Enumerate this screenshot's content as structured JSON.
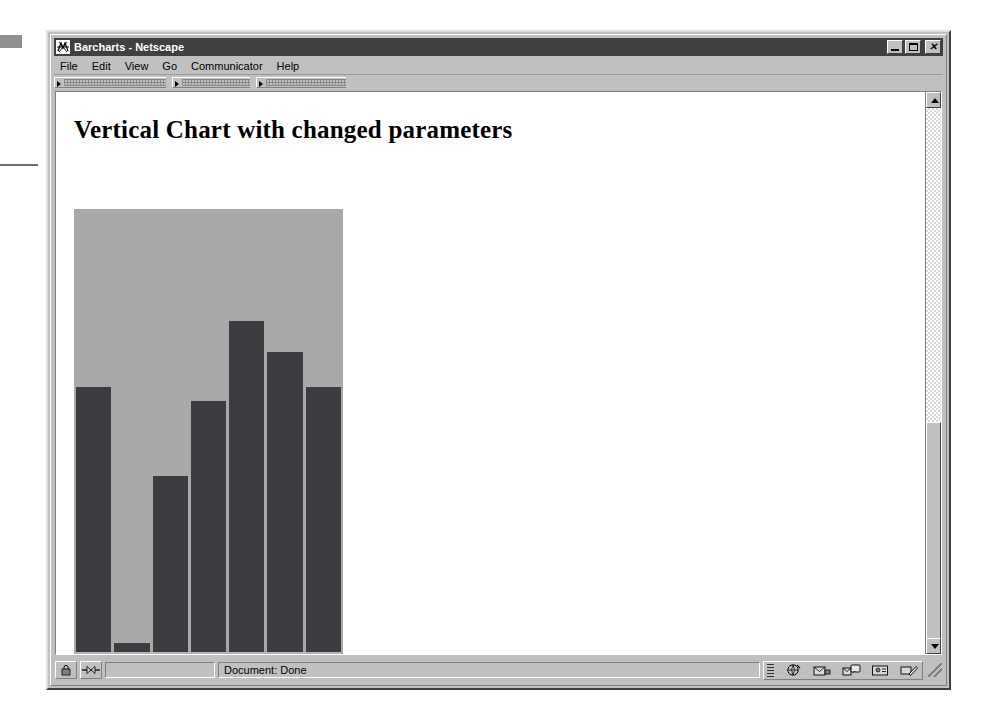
{
  "window": {
    "title": "Barcharts - Netscape",
    "icon": "netscape-logo-icon",
    "controls": {
      "minimize_label": "_",
      "maximize_label": "□",
      "close_label": "✕"
    }
  },
  "menubar": {
    "items": [
      {
        "label": "File",
        "accel": "F"
      },
      {
        "label": "Edit",
        "accel": "E"
      },
      {
        "label": "View",
        "accel": "V"
      },
      {
        "label": "Go",
        "accel": "G"
      },
      {
        "label": "Communicator",
        "accel": "C"
      },
      {
        "label": "Help",
        "accel": "H"
      }
    ]
  },
  "toolbar": {
    "grippies": [
      "navigation-toolbar-grippy",
      "location-toolbar-grippy",
      "personal-toolbar-grippy"
    ]
  },
  "page": {
    "heading": "Vertical Chart with changed parameters"
  },
  "chart_data": {
    "type": "bar",
    "title": "Vertical Chart with changed parameters",
    "orientation": "vertical",
    "categories": [
      "1",
      "2",
      "3",
      "4",
      "5",
      "6",
      "7"
    ],
    "values": [
      60,
      2,
      40,
      57,
      75,
      68,
      60
    ],
    "xlabel": "",
    "ylabel": "",
    "ylim": [
      0,
      100
    ],
    "grid": false,
    "legend": null,
    "bar_color": "#3d3d41",
    "plot_background": "#a9a9a9",
    "axis_background": "#b5b5b5",
    "axis_tick_labels": [
      "1",
      "2",
      "3",
      "4",
      "5",
      "6",
      "7"
    ],
    "bar_count": 7,
    "bar_gap_color": "#ffffff"
  },
  "scrollbar": {
    "up_arrow": "scroll-up-icon",
    "down_arrow": "scroll-down-icon",
    "thumb_top_pct": 60,
    "thumb_height_pct": 39
  },
  "statusbar": {
    "security_icon": "padlock-icon",
    "connection_icon": "connection-icon",
    "progress_value": "",
    "message": "Document: Done",
    "component_bar_icons": [
      "navigator-icon",
      "mailbox-icon",
      "newsgroups-icon",
      "address-book-icon",
      "composer-icon"
    ],
    "resize_grip": "resize-grip-icon"
  },
  "colors": {
    "window_face": "#c0c0c0",
    "titlebar_active": "#404040",
    "titlebar_text": "#ffffff",
    "bar_dark": "#3d3d41",
    "bar_light": "#a9a9a9",
    "page_background": "#ffffff"
  }
}
